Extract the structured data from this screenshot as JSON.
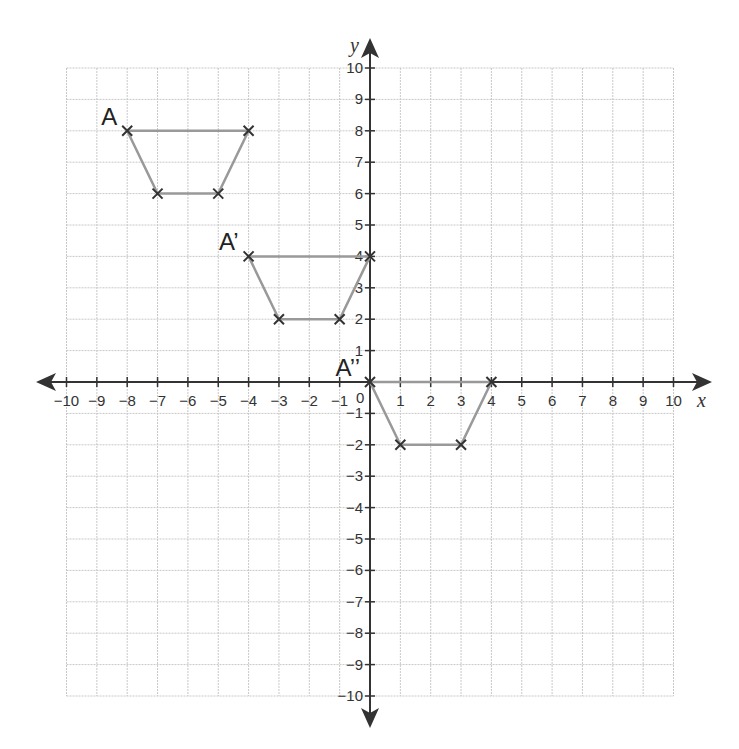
{
  "chart_data": {
    "type": "scatter",
    "title": "",
    "xlabel": "x",
    "ylabel": "y",
    "xlim": [
      -10,
      10
    ],
    "ylim": [
      -10,
      10
    ],
    "grid": true,
    "origin_label": "0",
    "x_ticks": [
      -10,
      -9,
      -8,
      -7,
      -6,
      -5,
      -4,
      -3,
      -2,
      -1,
      1,
      2,
      3,
      4,
      5,
      6,
      7,
      8,
      9,
      10
    ],
    "y_ticks": [
      -10,
      -9,
      -8,
      -7,
      -6,
      -5,
      -4,
      -3,
      -2,
      -1,
      1,
      2,
      3,
      4,
      5,
      6,
      7,
      8,
      9,
      10
    ],
    "series": [
      {
        "name": "A",
        "label": "A",
        "points": [
          [
            -8,
            8
          ],
          [
            -4,
            8
          ],
          [
            -5,
            6
          ],
          [
            -7,
            6
          ]
        ],
        "label_at": [
          -8,
          8
        ]
      },
      {
        "name": "A'",
        "label": "A’",
        "points": [
          [
            -4,
            4
          ],
          [
            0,
            4
          ],
          [
            -1,
            2
          ],
          [
            -3,
            2
          ]
        ],
        "label_at": [
          -4,
          4
        ]
      },
      {
        "name": "A''",
        "label": "A’’",
        "points": [
          [
            0,
            0
          ],
          [
            4,
            0
          ],
          [
            3,
            -2
          ],
          [
            1,
            -2
          ]
        ],
        "label_at": [
          0,
          0
        ]
      }
    ],
    "colors": {
      "grid": "#c8c8c8",
      "axis": "#333333",
      "shape": "#999999",
      "marker": "#333333"
    }
  }
}
